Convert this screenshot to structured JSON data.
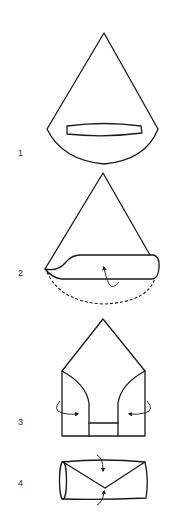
{
  "diagram": {
    "type": "folding-instructions",
    "colors": {
      "line": "#1a1a1a",
      "background": "#ffffff",
      "label": "#333333"
    },
    "steps": [
      {
        "number": "1",
        "description": "Cone shape with horizontal slot near rounded bottom"
      },
      {
        "number": "2",
        "description": "Bottom edge folded up into a band; dashed line shows original edge; curved arrow indicates fold upward"
      },
      {
        "number": "3",
        "description": "Pentagon shape; side flaps folded inward, arrows indicate inward folds"
      },
      {
        "number": "4",
        "description": "Rolled tube with envelope-style V fold; arrows indicate top and bottom folding to center"
      }
    ]
  }
}
